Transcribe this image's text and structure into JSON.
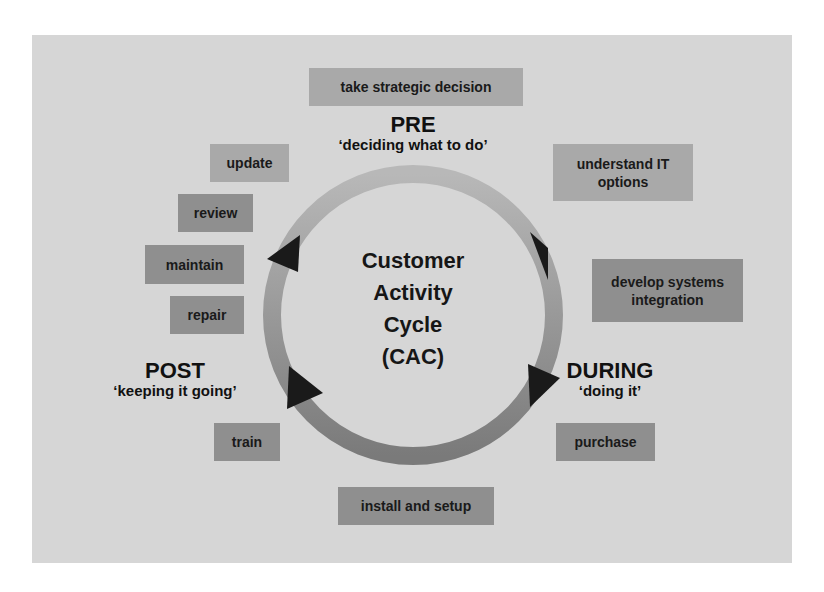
{
  "diagram": {
    "center_label": [
      "Customer",
      "Activity",
      "Cycle",
      "(CAC)"
    ],
    "phases": {
      "pre": {
        "title": "PRE",
        "subtitle": "‘deciding what to do’"
      },
      "during": {
        "title": "DURING",
        "subtitle": "‘doing it’"
      },
      "post": {
        "title": "POST",
        "subtitle": "‘keeping it going’"
      }
    },
    "activities": {
      "take_strategic_decision": "take strategic decision",
      "understand_it_options": "understand IT options",
      "develop_systems_integration": "develop systems integration",
      "purchase": "purchase",
      "install_and_setup": "install and setup",
      "train": "train",
      "repair": "repair",
      "maintain": "maintain",
      "review": "review",
      "update": "update"
    },
    "colors": {
      "panel": "#d6d6d6",
      "box_light": "#a9a9a9",
      "box_dark": "#8f8f8f",
      "ring_light": "#b3b3b3",
      "ring_dark": "#7d7d7d",
      "arrow": "#1a1a1a"
    }
  }
}
